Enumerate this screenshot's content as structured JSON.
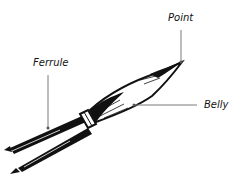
{
  "diagram": {
    "labels": {
      "point": "Point",
      "ferrule": "Ferrule",
      "belly": "Belly"
    },
    "colors": {
      "ink": "#111111",
      "leader_line": "#7a7a7a",
      "background": "#ffffff"
    }
  }
}
